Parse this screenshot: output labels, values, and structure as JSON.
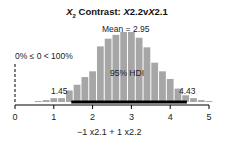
{
  "annotations": {
    "mean": "Mean = 2.95",
    "comp": "0% ≤ 0 < 100%",
    "hdi": "95% HDI",
    "hdi_low": "1.45",
    "hdi_high": "4.43"
  },
  "chart_data": {
    "type": "bar",
    "title": "X2 Contrast: X2.2vX2.1",
    "xlabel": "−1 x2.1 + 1 x2.2",
    "ylabel": "",
    "xticks": [
      "0",
      "1",
      "2",
      "3",
      "4",
      "5"
    ],
    "xlim": [
      0,
      5
    ],
    "bin_width": 0.2,
    "bin_centers": [
      0.6,
      0.8,
      1.0,
      1.2,
      1.4,
      1.6,
      1.8,
      2.0,
      2.2,
      2.4,
      2.6,
      2.8,
      3.0,
      3.2,
      3.4,
      3.6,
      3.8,
      4.0,
      4.2,
      4.4,
      4.6,
      4.8,
      5.0
    ],
    "values": [
      1,
      2,
      4,
      4,
      12,
      18,
      26,
      32,
      58,
      66,
      70,
      73,
      73,
      67,
      57,
      41,
      32,
      24,
      14,
      7,
      4,
      2,
      1
    ],
    "mean": 2.95,
    "hdi": [
      1.45,
      4.43
    ],
    "comparison_value": 0,
    "pct_below": "0%",
    "pct_above": "100%"
  }
}
